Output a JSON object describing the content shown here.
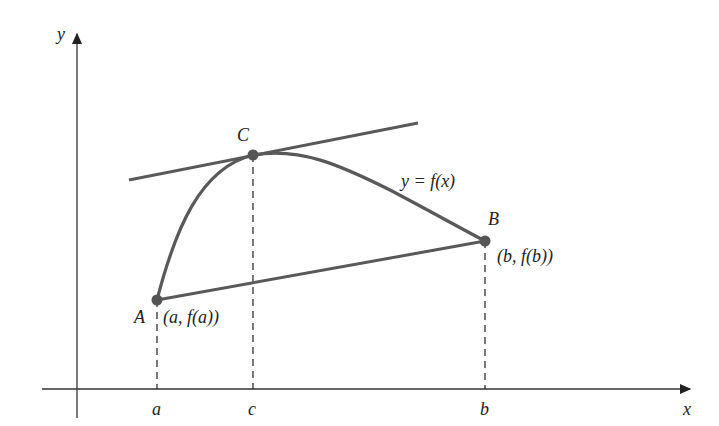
{
  "diagram": {
    "axes": {
      "x_label": "x",
      "y_label": "y"
    },
    "points": {
      "A": {
        "label": "A",
        "coord_label": "(a, f(a))"
      },
      "B": {
        "label": "B",
        "coord_label": "(b, f(b))"
      },
      "C": {
        "label": "C"
      }
    },
    "curve_label": "y = f(x)",
    "x_ticks": [
      "a",
      "c",
      "b"
    ],
    "colors": {
      "curve": "#595959",
      "axes": "#333333",
      "text": "#222222"
    }
  }
}
